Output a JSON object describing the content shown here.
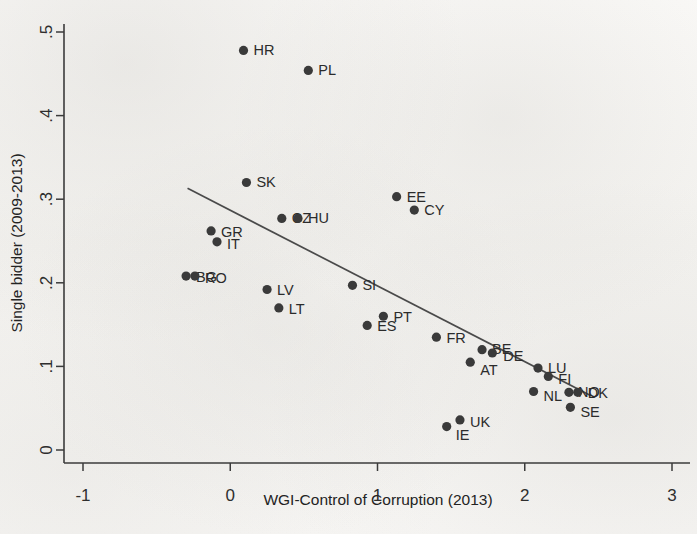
{
  "chart_data": {
    "type": "scatter",
    "title": "",
    "xlabel": "WGI-Control of Corruption (2013)",
    "ylabel": "Single bidder (2009-2013)",
    "xlim": [
      -1,
      3
    ],
    "ylim": [
      0,
      0.5
    ],
    "xticks": [
      "-1",
      "0",
      "1",
      "2",
      "3"
    ],
    "xtick_values": [
      -1,
      0,
      1,
      2,
      3
    ],
    "yticks": [
      "0",
      ".1",
      ".2",
      ".3",
      ".4",
      ".5"
    ],
    "ytick_values": [
      0,
      0.1,
      0.2,
      0.3,
      0.4,
      0.5
    ],
    "grid": false,
    "legend": null,
    "marker_color": "#3a3a3a",
    "line_color": "#4a4a4a",
    "points": [
      {
        "label": "HR",
        "x": 0.09,
        "y": 0.478,
        "lx": 10,
        "ly": 5
      },
      {
        "label": "PL",
        "x": 0.53,
        "y": 0.454,
        "lx": 10,
        "ly": 5
      },
      {
        "label": "SK",
        "x": 0.11,
        "y": 0.32,
        "lx": 10,
        "ly": 5
      },
      {
        "label": "EE",
        "x": 1.13,
        "y": 0.303,
        "lx": 10,
        "ly": 5
      },
      {
        "label": "CY",
        "x": 1.25,
        "y": 0.287,
        "lx": 10,
        "ly": 5
      },
      {
        "label": "CZ",
        "x": 0.35,
        "y": 0.277,
        "lx": 10,
        "ly": 5
      },
      {
        "label": "HU",
        "x": 0.46,
        "y": 0.277,
        "lx": 10,
        "ly": 5
      },
      {
        "label": "GR",
        "x": -0.13,
        "y": 0.262,
        "lx": 10,
        "ly": 6
      },
      {
        "label": "IT",
        "x": -0.09,
        "y": 0.249,
        "lx": 10,
        "ly": 7
      },
      {
        "label": "BG",
        "x": -0.3,
        "y": 0.208,
        "lx": 10,
        "ly": 6
      },
      {
        "label": "RO",
        "x": -0.24,
        "y": 0.208,
        "lx": 10,
        "ly": 7
      },
      {
        "label": "SI",
        "x": 0.83,
        "y": 0.197,
        "lx": 10,
        "ly": 5
      },
      {
        "label": "LV",
        "x": 0.25,
        "y": 0.192,
        "lx": 10,
        "ly": 6
      },
      {
        "label": "LT",
        "x": 0.33,
        "y": 0.17,
        "lx": 10,
        "ly": 6
      },
      {
        "label": "PT",
        "x": 1.04,
        "y": 0.16,
        "lx": 10,
        "ly": 6
      },
      {
        "label": "ES",
        "x": 0.93,
        "y": 0.149,
        "lx": 10,
        "ly": 6
      },
      {
        "label": "FR",
        "x": 1.4,
        "y": 0.135,
        "lx": 10,
        "ly": 6
      },
      {
        "label": "BE",
        "x": 1.71,
        "y": 0.12,
        "lx": 10,
        "ly": 4
      },
      {
        "label": "DE",
        "x": 1.78,
        "y": 0.116,
        "lx": 11,
        "ly": 8
      },
      {
        "label": "AT",
        "x": 1.63,
        "y": 0.105,
        "lx": 10,
        "ly": 13
      },
      {
        "label": "LU",
        "x": 2.09,
        "y": 0.098,
        "lx": 10,
        "ly": 5
      },
      {
        "label": "FI",
        "x": 2.16,
        "y": 0.088,
        "lx": 10,
        "ly": 8
      },
      {
        "label": "NL",
        "x": 2.06,
        "y": 0.07,
        "lx": 10,
        "ly": 10
      },
      {
        "label": "NO",
        "x": 2.3,
        "y": 0.069,
        "lx": 9,
        "ly": 5
      },
      {
        "label": "DK",
        "x": 2.36,
        "y": 0.069,
        "lx": 10,
        "ly": 6
      },
      {
        "label": "SE",
        "x": 2.31,
        "y": 0.051,
        "lx": 10,
        "ly": 10
      },
      {
        "label": "UK",
        "x": 1.56,
        "y": 0.036,
        "lx": 10,
        "ly": 7
      },
      {
        "label": "IE",
        "x": 1.47,
        "y": 0.028,
        "lx": 9,
        "ly": 13
      }
    ],
    "fit_line": {
      "name": "linear-fit",
      "x_start": -0.29,
      "y_start": 0.313,
      "x_end": 2.45,
      "y_end": 0.065
    }
  }
}
